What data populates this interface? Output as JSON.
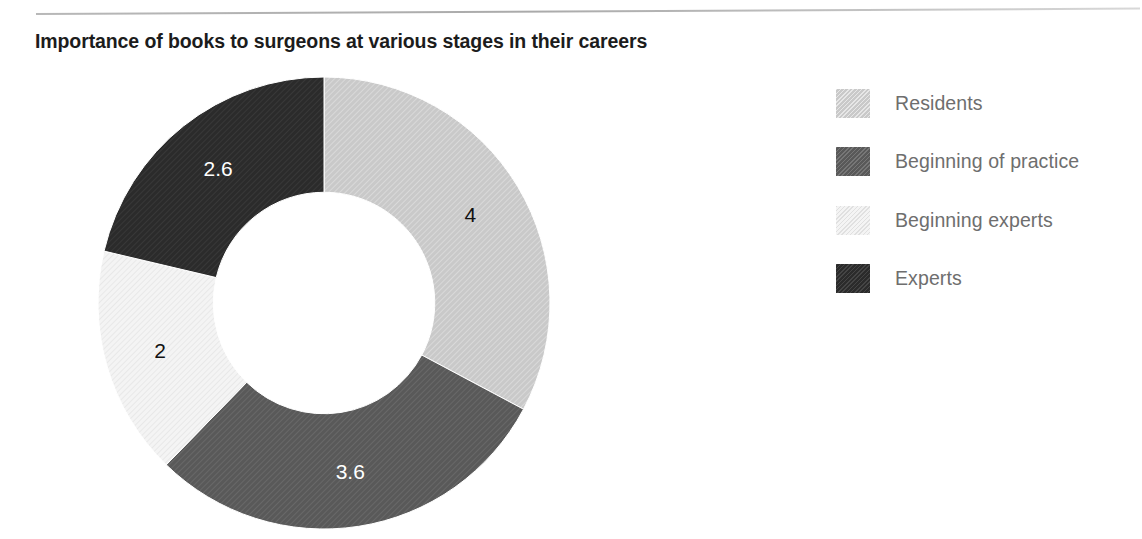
{
  "chart_data": {
    "type": "pie",
    "variant": "doughnut",
    "title": "Importance of books to surgeons at various stages in their careers",
    "categories": [
      "Residents",
      "Beginning of practice",
      "Beginning experts",
      "Experts"
    ],
    "values": [
      4,
      3.6,
      2,
      2.6
    ],
    "value_labels": [
      "4",
      "3.6",
      "2",
      "2.6"
    ],
    "total": 12.2,
    "start_angle_deg": 0,
    "direction": "clockwise",
    "inner_radius_ratio": 0.49,
    "legend_position": "right",
    "grid": false,
    "xlabel": "",
    "ylabel": "",
    "series": [
      {
        "name": "Importance rating",
        "points": [
          {
            "category": "Residents",
            "value": 4,
            "label": "4",
            "color": "#c9c9c9",
            "label_color": "#111111",
            "pattern": "diagonal-hatch"
          },
          {
            "category": "Beginning of practice",
            "value": 3.6,
            "label": "3.6",
            "color": "#595959",
            "label_color": "#ffffff",
            "pattern": "diagonal-hatch"
          },
          {
            "category": "Beginning experts",
            "value": 2,
            "label": "2",
            "color": "#f4f4f4",
            "label_color": "#111111",
            "pattern": "diagonal-hatch"
          },
          {
            "category": "Experts",
            "value": 2.6,
            "label": "2.6",
            "color": "#2b2b2b",
            "label_color": "#ffffff",
            "pattern": "diagonal-hatch"
          }
        ]
      }
    ]
  },
  "legend": {
    "items": [
      {
        "label": "Residents",
        "swatch_name": "legend-swatch-residents",
        "color": "#c9c9c9"
      },
      {
        "label": "Beginning of practice",
        "swatch_name": "legend-swatch-begpractice",
        "color": "#595959"
      },
      {
        "label": "Beginning experts",
        "swatch_name": "legend-swatch-begexperts",
        "color": "#f4f4f4"
      },
      {
        "label": "Experts",
        "swatch_name": "legend-swatch-experts",
        "color": "#2b2b2b"
      }
    ]
  },
  "colors": {
    "title": "#1c1c1c",
    "legend_text": "#6e6e6e",
    "rule": "#b4b4b4",
    "background": "#ffffff"
  }
}
